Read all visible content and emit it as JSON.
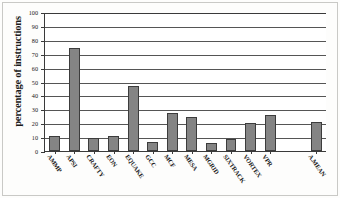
{
  "chart_data": {
    "type": "bar",
    "title": "",
    "xlabel": "",
    "ylabel": "percentage of instructions",
    "ylim": [
      0,
      100
    ],
    "yticks": [
      0,
      10,
      20,
      30,
      40,
      50,
      60,
      70,
      80,
      90,
      100
    ],
    "grid": true,
    "legend": "none",
    "categories": [
      "AMMP",
      "APSI",
      "CRAFTY",
      "EON",
      "EQUAKE",
      "GCC",
      "MCF",
      "MESA",
      "MGRID",
      "SIXTRACK",
      "VORTEX",
      "VPR",
      "A.MEAN"
    ],
    "values": [
      11,
      74,
      9.5,
      10.5,
      46.5,
      6.5,
      27.5,
      24.5,
      6,
      8.5,
      20,
      26,
      21
    ],
    "bar_color": "#848484",
    "bar_edge_color": "#3c3c3c",
    "axis_color": "#3a3a3a",
    "gridline_color": "#555555",
    "background_color": "#ffffff"
  }
}
